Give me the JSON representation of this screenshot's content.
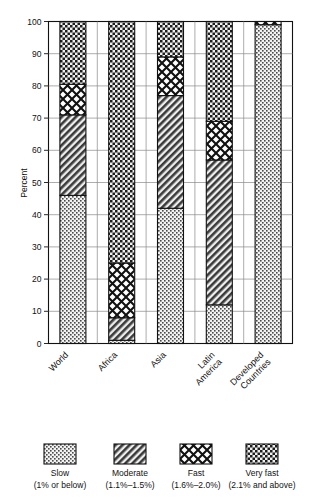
{
  "chart_data": {
    "type": "bar",
    "subtype": "stacked-bar-100",
    "title": "",
    "xlabel": "",
    "ylabel": "Percent",
    "ylim": [
      0,
      100
    ],
    "yticks": [
      0,
      10,
      20,
      30,
      40,
      50,
      60,
      70,
      80,
      90,
      100
    ],
    "grid": true,
    "legend_position": "bottom",
    "categories": [
      "World",
      "Africa",
      "Asia",
      "Latin America",
      "Developed Countries"
    ],
    "series": [
      {
        "name": "Slow",
        "range": "1% or below",
        "values": [
          46,
          1,
          42,
          12,
          99
        ]
      },
      {
        "name": "Moderate",
        "range": "1.1%-1.5%",
        "values": [
          25,
          7,
          35,
          45,
          0
        ]
      },
      {
        "name": "Fast",
        "range": "1.6%-2.0%",
        "values": [
          9.5,
          17,
          12,
          12,
          1
        ]
      },
      {
        "name": "Very fast",
        "range": "2.1% and above",
        "values": [
          19.5,
          75,
          11,
          31,
          0
        ]
      }
    ],
    "segment_boundaries": {
      "World": [
        0,
        46,
        71,
        80.5,
        100
      ],
      "Africa": [
        0,
        1,
        8,
        25,
        100
      ],
      "Asia": [
        0,
        42,
        77,
        89,
        100
      ],
      "Latin America": [
        0,
        12,
        57,
        69,
        100
      ],
      "Developed Countries": [
        0,
        99,
        99,
        100,
        100
      ]
    }
  },
  "axis": {
    "y_label": "Percent",
    "y_ticks": [
      "0",
      "10",
      "20",
      "30",
      "40",
      "50",
      "60",
      "70",
      "80",
      "90",
      "100"
    ]
  },
  "categories": [
    {
      "label": "World"
    },
    {
      "label": "Africa"
    },
    {
      "label": "Asia"
    },
    {
      "label": "Latin",
      "label2": "America"
    },
    {
      "label": "Developed",
      "label2": "Countries"
    }
  ],
  "legend": {
    "items": [
      {
        "name": "Slow",
        "sub": "(1% or below)",
        "pattern": "dots-fine",
        "swatch_icon": "legend-swatch-slow"
      },
      {
        "name": "Moderate",
        "sub": "(1.1%–1.5%)",
        "pattern": "diagonal-hatch",
        "swatch_icon": "legend-swatch-moderate"
      },
      {
        "name": "Fast",
        "sub": "(1.6%–2.0%)",
        "pattern": "crosshatch-diamond",
        "swatch_icon": "legend-swatch-fast"
      },
      {
        "name": "Very fast",
        "sub": "(2.1% and above)",
        "pattern": "checker",
        "swatch_icon": "legend-swatch-veryfast"
      }
    ]
  },
  "colors": {
    "ink": "#111111",
    "grid": "#8a8a8a",
    "fill_light": "#e9e9e9",
    "background": "#ffffff"
  }
}
